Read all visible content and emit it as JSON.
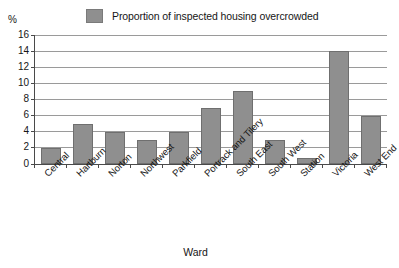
{
  "chart_data": {
    "type": "bar",
    "title": "",
    "subtitle": "",
    "xlabel": "Ward",
    "ylabel": "%",
    "ylim": [
      0,
      16
    ],
    "ytick_step": 2,
    "yticks": [
      0,
      2,
      4,
      6,
      8,
      10,
      12,
      14,
      16
    ],
    "grid": true,
    "legend_position": "top-center",
    "legend": [
      "Proportion of inspected housing overcrowded"
    ],
    "categories": [
      "Central",
      "Hartburn",
      "Norton",
      "Northwest",
      "Parkfield",
      "Portrack and Tilery",
      "South East",
      "South West",
      "Station",
      "Victoria",
      "West End"
    ],
    "series": [
      {
        "name": "Proportion of inspected housing overcrowded",
        "color": "#8f8f8f",
        "values": [
          2,
          5,
          4,
          3,
          4,
          7,
          9,
          3,
          0.8,
          14,
          6
        ]
      }
    ]
  },
  "colors": {
    "bar_fill": "#8f8f8f",
    "bar_edge": "#6f6f6f",
    "gridline": "#9a9a9a",
    "axis": "#4a4a4a",
    "text": "#161616",
    "background": "#ffffff"
  }
}
